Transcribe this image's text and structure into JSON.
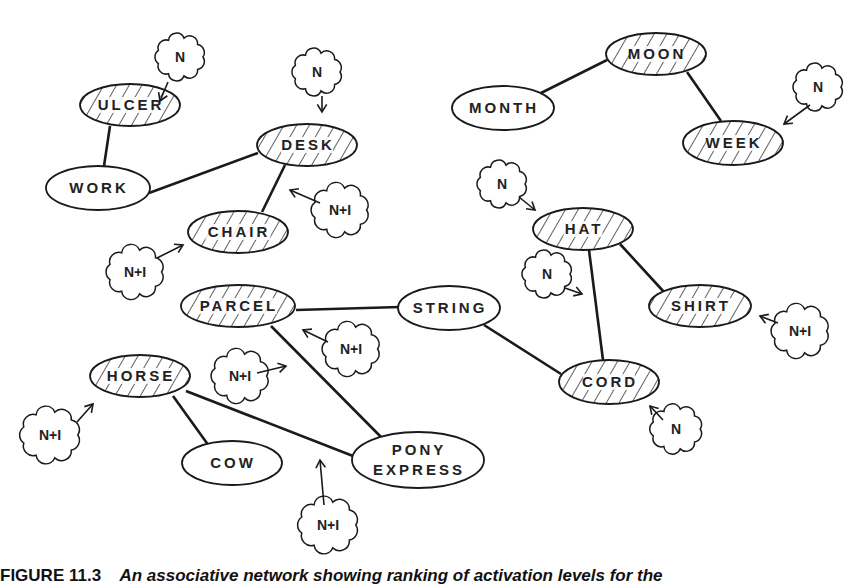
{
  "diagram": {
    "type": "associative-network",
    "colors": {
      "stroke": "#1a1a1a",
      "background": "#ffffff",
      "hatch": "#1a1a1a"
    },
    "nodes": [
      {
        "id": "ulcer",
        "label": "ULCER",
        "x": 130,
        "y": 105,
        "rx": 50,
        "ry": 21,
        "hatched": true
      },
      {
        "id": "work",
        "label": "WORK",
        "x": 98,
        "y": 188,
        "rx": 52,
        "ry": 22,
        "hatched": false
      },
      {
        "id": "desk",
        "label": "DESK",
        "x": 307,
        "y": 145,
        "rx": 50,
        "ry": 21,
        "hatched": true
      },
      {
        "id": "chair",
        "label": "CHAIR",
        "x": 238,
        "y": 232,
        "rx": 50,
        "ry": 21,
        "hatched": true
      },
      {
        "id": "moon",
        "label": "MOON",
        "x": 656,
        "y": 54,
        "rx": 50,
        "ry": 21,
        "hatched": true
      },
      {
        "id": "month",
        "label": "MONTH",
        "x": 503,
        "y": 108,
        "rx": 51,
        "ry": 22,
        "hatched": false
      },
      {
        "id": "week",
        "label": "WEEK",
        "x": 733,
        "y": 143,
        "rx": 50,
        "ry": 22,
        "hatched": true
      },
      {
        "id": "hat",
        "label": "HAT",
        "x": 583,
        "y": 229,
        "rx": 50,
        "ry": 21,
        "hatched": true
      },
      {
        "id": "shirt",
        "label": "SHIRT",
        "x": 700,
        "y": 306,
        "rx": 51,
        "ry": 21,
        "hatched": true
      },
      {
        "id": "parcel",
        "label": "PARCEL",
        "x": 238,
        "y": 306,
        "rx": 57,
        "ry": 21,
        "hatched": true
      },
      {
        "id": "string",
        "label": "STRING",
        "x": 449,
        "y": 308,
        "rx": 51,
        "ry": 22,
        "hatched": false
      },
      {
        "id": "cord",
        "label": "CORD",
        "x": 609,
        "y": 382,
        "rx": 50,
        "ry": 22,
        "hatched": true
      },
      {
        "id": "horse",
        "label": "HORSE",
        "x": 140,
        "y": 376,
        "rx": 50,
        "ry": 21,
        "hatched": true
      },
      {
        "id": "cow",
        "label": "COW",
        "x": 232,
        "y": 463,
        "rx": 50,
        "ry": 22,
        "hatched": false
      },
      {
        "id": "pony",
        "label": "PONY",
        "label2": "EXPRESS",
        "x": 418,
        "y": 460,
        "rx": 66,
        "ry": 28,
        "hatched": false
      }
    ],
    "edges": [
      {
        "from": "ulcer",
        "to": "work",
        "x1": 110,
        "y1": 126,
        "x2": 104,
        "y2": 166
      },
      {
        "from": "work",
        "to": "desk",
        "x1": 149,
        "y1": 193,
        "x2": 258,
        "y2": 153
      },
      {
        "from": "desk",
        "to": "chair",
        "x1": 285,
        "y1": 165,
        "x2": 262,
        "y2": 212
      },
      {
        "from": "moon",
        "to": "month",
        "x1": 607,
        "y1": 60,
        "x2": 541,
        "y2": 93
      },
      {
        "from": "moon",
        "to": "week",
        "x1": 687,
        "y1": 72,
        "x2": 721,
        "y2": 121
      },
      {
        "from": "hat",
        "to": "shirt",
        "x1": 620,
        "y1": 244,
        "x2": 664,
        "y2": 292
      },
      {
        "from": "hat",
        "to": "cord",
        "x1": 589,
        "y1": 250,
        "x2": 603,
        "y2": 360
      },
      {
        "from": "parcel",
        "to": "string",
        "x1": 296,
        "y1": 310,
        "x2": 400,
        "y2": 307
      },
      {
        "from": "string",
        "to": "cord",
        "x1": 484,
        "y1": 325,
        "x2": 561,
        "y2": 374
      },
      {
        "from": "parcel",
        "to": "pony",
        "x1": 271,
        "y1": 326,
        "x2": 381,
        "y2": 437
      },
      {
        "from": "horse",
        "to": "cow",
        "x1": 173,
        "y1": 396,
        "x2": 209,
        "y2": 446
      },
      {
        "from": "horse",
        "to": "pony",
        "x1": 186,
        "y1": 391,
        "x2": 353,
        "y2": 456
      }
    ],
    "clouds": [
      {
        "label": "N",
        "x": 180,
        "y": 57,
        "scale": 0.95,
        "arrow": [
          168,
          82,
          160,
          101
        ]
      },
      {
        "label": "N",
        "x": 317,
        "y": 72,
        "scale": 0.95,
        "arrow": [
          322,
          96,
          322,
          112
        ]
      },
      {
        "label": "N+I",
        "x": 340,
        "y": 210,
        "scale": 1.1,
        "arrow": [
          320,
          203,
          290,
          190
        ]
      },
      {
        "label": "N+I",
        "x": 135,
        "y": 272,
        "scale": 1.1,
        "arrow": [
          157,
          258,
          183,
          245
        ]
      },
      {
        "label": "N",
        "x": 818,
        "y": 87,
        "scale": 0.95,
        "arrow": [
          810,
          105,
          784,
          124
        ]
      },
      {
        "label": "N",
        "x": 502,
        "y": 184,
        "scale": 0.95,
        "arrow": [
          519,
          197,
          535,
          210
        ]
      },
      {
        "label": "N",
        "x": 547,
        "y": 274,
        "scale": 0.95,
        "arrow": [
          565,
          288,
          582,
          294
        ]
      },
      {
        "label": "N+I",
        "x": 800,
        "y": 331,
        "scale": 1.1,
        "arrow": [
          778,
          323,
          760,
          316
        ]
      },
      {
        "label": "N+I",
        "x": 351,
        "y": 349,
        "scale": 1.1,
        "arrow": [
          328,
          342,
          303,
          330
        ]
      },
      {
        "label": "N+I",
        "x": 240,
        "y": 376,
        "scale": 1.1,
        "arrow": [
          257,
          373,
          286,
          366
        ]
      },
      {
        "label": "N",
        "x": 676,
        "y": 429,
        "scale": 1.0,
        "arrow": [
          663,
          420,
          650,
          406
        ]
      },
      {
        "label": "N+I",
        "x": 50,
        "y": 435,
        "scale": 1.15,
        "arrow": [
          77,
          422,
          93,
          404
        ]
      },
      {
        "label": "N+I",
        "x": 328,
        "y": 525,
        "scale": 1.15,
        "arrow": [
          324,
          505,
          320,
          460
        ]
      }
    ]
  },
  "caption": {
    "figure_label": "FIGURE 11.3",
    "text": "An associative network showing ranking of activation levels for the"
  }
}
